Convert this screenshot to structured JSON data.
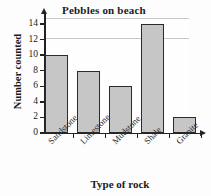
{
  "chart_data": {
    "type": "bar",
    "title": "Pebbles on beach",
    "xlabel": "Type of rock",
    "ylabel": "Number counted",
    "categories": [
      "Sandstone",
      "Limestone",
      "Mudstone",
      "Shale",
      "Granite"
    ],
    "values": [
      10,
      8,
      6,
      14,
      2
    ],
    "ylim": [
      0,
      14
    ],
    "ytick_labels": [
      "0",
      "2",
      "4",
      "6",
      "8",
      "10",
      "12",
      "14"
    ],
    "ytick_values": [
      0,
      2,
      4,
      6,
      8,
      10,
      12,
      14
    ],
    "grid": true,
    "legend": "none",
    "bar_fill_color": "#c6c6c6",
    "bar_edge_color": "#2b2b2b",
    "grid_color": "#e6e6e6",
    "axis_color": "#222222"
  }
}
